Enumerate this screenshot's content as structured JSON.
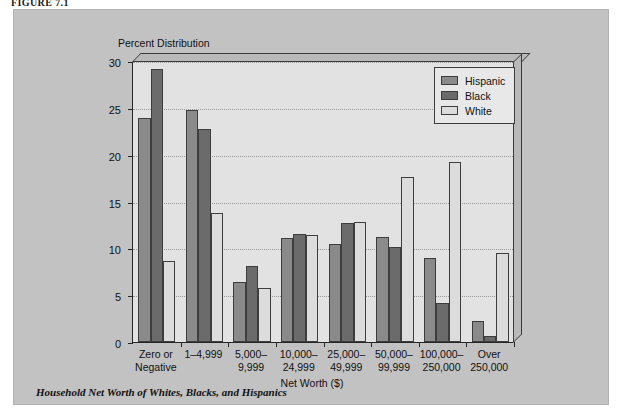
{
  "figure": {
    "label": "FIGURE 7.1",
    "caption": "Household Net Worth of Whites, Blacks, and Hispanics"
  },
  "legend": {
    "position": "top-right",
    "entries": [
      {
        "label": "Hispanic",
        "color": "#8a8a8a"
      },
      {
        "label": "Black",
        "color": "#6b6b6b"
      },
      {
        "label": "White",
        "color": "#dcdcdc"
      }
    ]
  },
  "chart_data": {
    "type": "bar",
    "title": "",
    "xlabel": "Net Worth ($)",
    "ylabel": "Percent Distribution",
    "ylim": [
      0,
      30
    ],
    "yticks": [
      0,
      5,
      10,
      15,
      20,
      25,
      30
    ],
    "grid": true,
    "categories": [
      "Zero or\nNegative",
      "1–4,999",
      "5,000–\n9,999",
      "10,000–\n24,999",
      "25,000–\n49,999",
      "50,000–\n99,999",
      "100,000–\n250,000",
      "Over\n250,000"
    ],
    "series": [
      {
        "name": "Hispanic",
        "color": "#8a8a8a",
        "values": [
          23.9,
          24.8,
          6.4,
          11.1,
          10.5,
          11.2,
          9.0,
          2.2
        ]
      },
      {
        "name": "Black",
        "color": "#6b6b6b",
        "values": [
          29.2,
          22.7,
          8.1,
          11.5,
          12.7,
          10.1,
          4.2,
          0.6
        ]
      },
      {
        "name": "White",
        "color": "#dcdcdc",
        "values": [
          8.6,
          13.8,
          5.8,
          11.4,
          12.8,
          17.6,
          19.2,
          9.5
        ]
      }
    ]
  }
}
